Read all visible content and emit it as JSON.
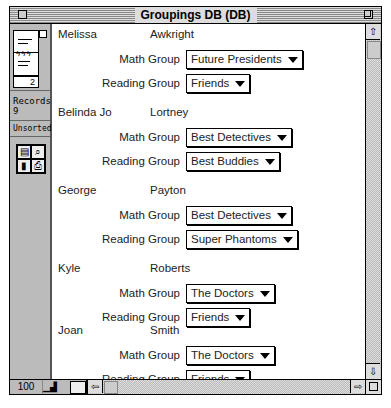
{
  "window": {
    "title": "Groupings DB (DB)"
  },
  "sidebar": {
    "page_number": "2",
    "records_label": "Records:",
    "records_count": "9",
    "sort_status": "Unsorted",
    "tools": [
      "layout-icon",
      "find-icon",
      "chart-icon",
      "print-icon"
    ]
  },
  "labels": {
    "math": "Math Group",
    "reading": "Reading Group"
  },
  "records": [
    {
      "first": "Melissa",
      "last": "Awkright",
      "math": "Future Presidents",
      "reading": "Friends"
    },
    {
      "first": "Belinda Jo",
      "last": "Lortney",
      "math": "Best Detectives",
      "reading": "Best Buddies"
    },
    {
      "first": "George",
      "last": "Payton",
      "math": "Best Detectives",
      "reading": "Super Phantoms"
    },
    {
      "first": "Kyle",
      "last": "Roberts",
      "math": "The Doctors",
      "reading": "Friends"
    },
    {
      "first": "Joan",
      "last": "Smith",
      "math": "The Doctors",
      "reading": "Friends"
    }
  ],
  "bottom": {
    "zoom_level": "100"
  },
  "icons": {
    "up": "⇧",
    "down": "⇩",
    "left": "⇦",
    "right": "⇨"
  }
}
